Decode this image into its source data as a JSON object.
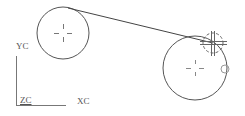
{
  "canvas": {
    "width": 245,
    "height": 116,
    "background": "#ffffff",
    "stroke": "#4a4a4a"
  },
  "axes": {
    "y_label": "YC",
    "z_label": "ZC",
    "x_label": "XC"
  },
  "geometry": {
    "circle_1": {
      "cx": 63,
      "cy": 33,
      "r": 26
    },
    "circle_2": {
      "cx": 195,
      "cy": 68,
      "r": 32
    },
    "tangent_line": {
      "x1": 68,
      "y1": 8,
      "x2": 213,
      "y2": 43
    },
    "snap_marker": {
      "cx": 213,
      "cy": 43,
      "r": 10
    },
    "small_circle": {
      "cx": 225,
      "cy": 69,
      "r": 4
    }
  }
}
